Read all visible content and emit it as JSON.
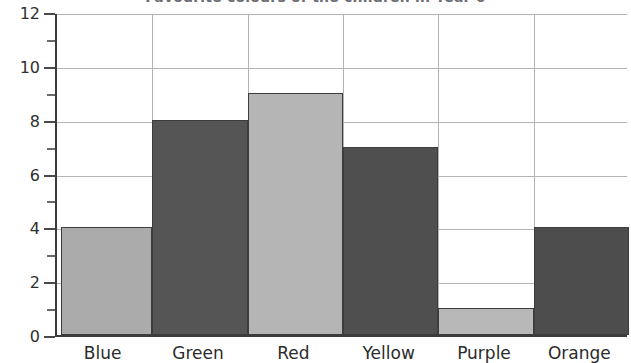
{
  "chart_data": {
    "type": "bar",
    "title": "Favourite colours of the children in Year 6",
    "xlabel": "",
    "ylabel": "",
    "categories": [
      "Blue",
      "Green",
      "Red",
      "Yellow",
      "Purple",
      "Orange"
    ],
    "values": [
      4,
      8,
      9,
      7,
      1,
      4
    ],
    "ylim": [
      0,
      12
    ],
    "ytick_labels": [
      "0",
      "2",
      "4",
      "6",
      "8",
      "10",
      "12"
    ],
    "ytick_values": [
      0,
      2,
      4,
      6,
      8,
      10,
      12
    ],
    "minor_tick_step": 1,
    "grid": true,
    "legend": false,
    "bar_fills": [
      "#ababab",
      "#555555",
      "#b5b5b5",
      "#4f4f4f",
      "#b8b8b8",
      "#4d4d4d"
    ],
    "bar_border_color": "#3d3d3d",
    "grid_color": "#b4b4b4",
    "axis_color": "#3b3b3b"
  }
}
